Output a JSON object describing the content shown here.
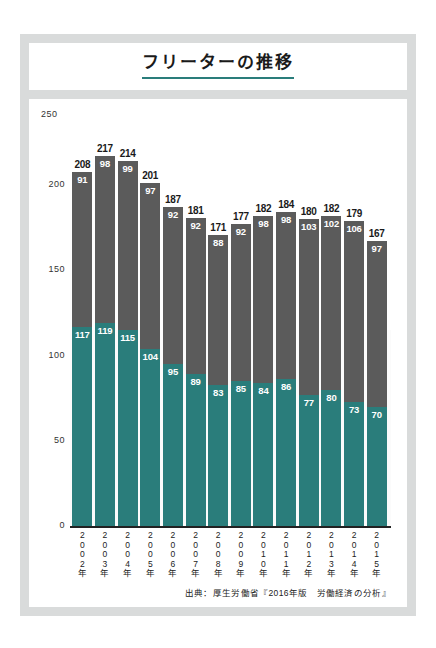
{
  "title": "フリーターの推移",
  "unit_label": "（万人）",
  "y_max_label": "250",
  "legend": [
    {
      "label": "15〜24歳",
      "color": "#2a7d7b",
      "key": "younger"
    },
    {
      "label": "25〜34歳",
      "color": "#5b5b5b",
      "key": "older"
    }
  ],
  "source": "出典：厚生労働省『2016年版　労働経済の分析』",
  "chart_data": {
    "type": "bar",
    "subtype": "stacked",
    "title": "フリーターの推移",
    "xlabel": "",
    "ylabel": "（万人）",
    "ylim": [
      0,
      250
    ],
    "yticks": [
      0,
      50,
      100,
      150,
      200,
      250
    ],
    "ytick_labels": [
      "0",
      "50",
      "100",
      "150",
      "200",
      "250"
    ],
    "grid": false,
    "legend_position": "top-right",
    "categories": [
      "2002年",
      "2003年",
      "2004年",
      "2005年",
      "2006年",
      "2007年",
      "2008年",
      "2009年",
      "2010年",
      "2011年",
      "2012年",
      "2013年",
      "2014年",
      "2015年"
    ],
    "series": [
      {
        "name": "15〜24歳",
        "color": "#2a7d7b",
        "values": [
          117,
          119,
          115,
          104,
          95,
          89,
          83,
          85,
          84,
          86,
          77,
          80,
          73,
          70
        ]
      },
      {
        "name": "25〜34歳",
        "color": "#5b5b5b",
        "values": [
          91,
          98,
          99,
          97,
          92,
          92,
          88,
          92,
          98,
          98,
          103,
          102,
          106,
          97
        ]
      }
    ],
    "totals": [
      208,
      217,
      214,
      201,
      187,
      181,
      171,
      177,
      182,
      184,
      180,
      182,
      179,
      167
    ]
  }
}
